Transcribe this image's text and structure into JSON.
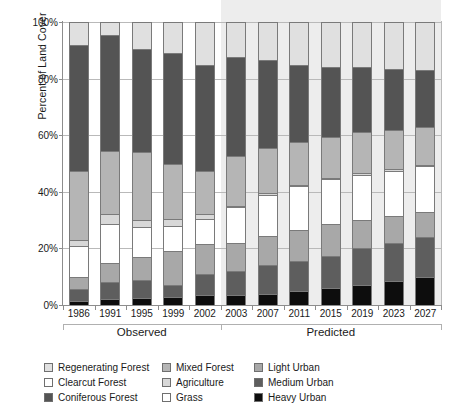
{
  "chart_data": {
    "type": "bar",
    "subtype": "stacked-percent",
    "title": "",
    "xlabel": "",
    "ylabel": "Percent of Land Cover",
    "ylim": [
      0,
      100
    ],
    "ytick_labels": [
      "0%",
      "20%",
      "40%",
      "60%",
      "80%",
      "100%"
    ],
    "ytick_values": [
      0,
      20,
      40,
      60,
      80,
      100
    ],
    "grid": true,
    "legend_position": "bottom",
    "categories": [
      "1986",
      "1991",
      "1995",
      "1999",
      "2002",
      "2003",
      "2007",
      "2011",
      "2015",
      "2019",
      "2023",
      "2027"
    ],
    "groups": [
      {
        "label": "Observed",
        "categories": [
          "1986",
          "1991",
          "1995",
          "1999",
          "2002"
        ]
      },
      {
        "label": "Predicted",
        "categories": [
          "2003",
          "2007",
          "2011",
          "2015",
          "2019",
          "2023",
          "2027"
        ]
      }
    ],
    "stack_order_bottom_to_top": [
      "Heavy Urban",
      "Medium Urban",
      "Light Urban",
      "Grass",
      "Agriculture",
      "Mixed Forest",
      "Clearcut Forest",
      "Coniferous Forest",
      "Regenerating Forest"
    ],
    "series": [
      {
        "name": "Heavy Urban",
        "color": "#0d0d0d",
        "values": [
          1.5,
          2.0,
          2.5,
          3.0,
          3.5,
          3.5,
          4.0,
          5.0,
          6.0,
          7.0,
          8.5,
          10.0
        ]
      },
      {
        "name": "Medium Urban",
        "color": "#5e5e5e",
        "values": [
          4.0,
          6.0,
          6.5,
          4.0,
          7.5,
          8.5,
          10.0,
          10.5,
          11.5,
          13.0,
          13.5,
          14.0
        ]
      },
      {
        "name": "Light Urban",
        "color": "#a8a8a8",
        "values": [
          4.5,
          7.0,
          8.0,
          12.0,
          10.5,
          10.0,
          10.5,
          11.0,
          11.0,
          10.0,
          9.5,
          9.0
        ]
      },
      {
        "name": "Grass",
        "color": "#ffffff",
        "values": [
          11.0,
          13.5,
          10.5,
          9.0,
          9.0,
          12.5,
          14.5,
          15.5,
          16.0,
          16.0,
          16.0,
          16.0
        ]
      },
      {
        "name": "Agriculture",
        "color": "#d8d8d8",
        "values": [
          2.0,
          3.5,
          2.5,
          2.5,
          1.5,
          0.5,
          0.5,
          0.5,
          0.5,
          0.5,
          0.5,
          0.5
        ]
      },
      {
        "name": "Mixed Forest",
        "color": "#b5b5b5",
        "values": [
          24.5,
          22.5,
          24.0,
          19.5,
          15.5,
          17.5,
          16.0,
          15.0,
          14.5,
          14.5,
          14.0,
          13.5
        ]
      },
      {
        "name": "Clearcut Forest",
        "color": "#ffffff",
        "values": [
          0.0,
          0.0,
          0.0,
          0.0,
          0.0,
          0.0,
          0.0,
          0.0,
          0.0,
          0.0,
          0.0,
          0.0
        ]
      },
      {
        "name": "Coniferous Forest",
        "color": "#545454",
        "values": [
          44.5,
          41.0,
          36.5,
          39.0,
          37.5,
          35.0,
          31.0,
          27.5,
          24.5,
          23.0,
          21.5,
          20.0
        ]
      },
      {
        "name": "Regenerating Forest",
        "color": "#e0e0e0",
        "values": [
          8.0,
          4.5,
          9.5,
          11.0,
          15.0,
          12.5,
          13.5,
          15.0,
          16.0,
          16.0,
          16.5,
          17.0
        ]
      }
    ]
  },
  "legend": {
    "items": [
      {
        "label": "Regenerating Forest",
        "color": "#e0e0e0",
        "name": "regenerating-forest"
      },
      {
        "label": "Mixed Forest",
        "color": "#b5b5b5",
        "name": "mixed-forest"
      },
      {
        "label": "Light Urban",
        "color": "#a8a8a8",
        "name": "light-urban"
      },
      {
        "label": "Clearcut Forest",
        "color": "#ffffff",
        "name": "clearcut-forest"
      },
      {
        "label": "Agriculture",
        "color": "#d8d8d8",
        "name": "agriculture"
      },
      {
        "label": "Medium Urban",
        "color": "#5e5e5e",
        "name": "medium-urban"
      },
      {
        "label": "Coniferous Forest",
        "color": "#545454",
        "name": "coniferous-forest"
      },
      {
        "label": "Grass",
        "color": "#ffffff",
        "name": "grass"
      },
      {
        "label": "Heavy Urban",
        "color": "#0d0d0d",
        "name": "heavy-urban"
      }
    ],
    "column_order": "column-major"
  },
  "colors": {
    "gridline": "#b9b9b9",
    "axis": "#8d8d8d",
    "predicted_background": "#ededed",
    "text": "#1a1a1a",
    "bar_outline": "#7a7a7a"
  }
}
